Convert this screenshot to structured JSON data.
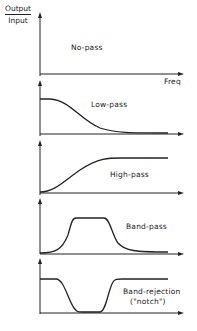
{
  "axes": {
    "y_label_numerator": "Output",
    "y_label_denominator": "Input",
    "x_label": "Freq"
  },
  "panels": [
    {
      "name": "No-pass",
      "label": "No-pass"
    },
    {
      "name": "Low-pass",
      "label": "Low-pass"
    },
    {
      "name": "High-pass",
      "label": "High-pass"
    },
    {
      "name": "Band-pass",
      "label": "Band-pass"
    },
    {
      "name": "Band-rejection",
      "label": "Band-rejection",
      "sublabel": "(\"notch\")"
    }
  ],
  "colors": {
    "ink": "#222222",
    "background": "#ffffff"
  }
}
